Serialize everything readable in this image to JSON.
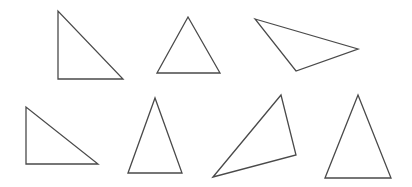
{
  "canvas": {
    "width": 412,
    "height": 187,
    "background": "#ffffff",
    "stroke": "#4a4a4a"
  },
  "triangles": [
    {
      "id": "right-triangle-1",
      "type": "right",
      "points": "58,11 58,79 123,79"
    },
    {
      "id": "isosceles-triangle-1",
      "type": "acute",
      "points": "157,73 188,17 220,73"
    },
    {
      "id": "obtuse-triangle-1",
      "type": "obtuse",
      "points": "255,19 358,49 296,71"
    },
    {
      "id": "right-triangle-2",
      "type": "right",
      "points": "26,107 26,164 98,164"
    },
    {
      "id": "isosceles-triangle-2",
      "type": "acute",
      "points": "128,173 155,98 182,173"
    },
    {
      "id": "obtuse-triangle-2",
      "type": "obtuse",
      "points": "213,177 281,95 296,155"
    },
    {
      "id": "isosceles-triangle-3",
      "type": "acute",
      "points": "325,178 358,95 391,178"
    }
  ]
}
